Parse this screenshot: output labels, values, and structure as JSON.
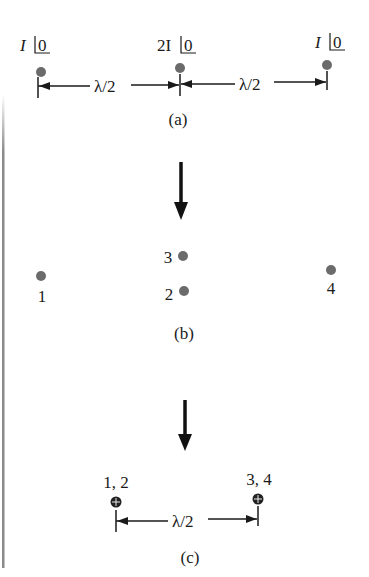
{
  "diagram": {
    "colors": {
      "dot": "#6b6b6b",
      "line": "#1a1a1a",
      "border": "#8a8a8a",
      "background": "#ffffff"
    },
    "panel_a": {
      "caption": "(a)",
      "elements": [
        {
          "current_label": "I",
          "angle": "0",
          "x": 41,
          "y": 72
        },
        {
          "current_label": "2I",
          "angle": "0",
          "x": 180,
          "y": 68
        },
        {
          "current_label": "I",
          "angle": "0",
          "x": 327,
          "y": 65
        }
      ],
      "spacing": [
        "λ/2",
        "λ/2"
      ]
    },
    "panel_b": {
      "caption": "(b)",
      "elements": [
        {
          "label": "1",
          "x": 41,
          "y": 276
        },
        {
          "label": "2",
          "x": 184,
          "y": 291
        },
        {
          "label": "3",
          "x": 183,
          "y": 256
        },
        {
          "label": "4",
          "x": 331,
          "y": 270
        }
      ]
    },
    "panel_c": {
      "caption": "(c)",
      "elements": [
        {
          "label": "1, 2",
          "x": 116,
          "y": 502
        },
        {
          "label": "3, 4",
          "x": 258,
          "y": 499
        }
      ],
      "spacing": "λ/2"
    },
    "arrows": [
      "down",
      "down"
    ]
  }
}
